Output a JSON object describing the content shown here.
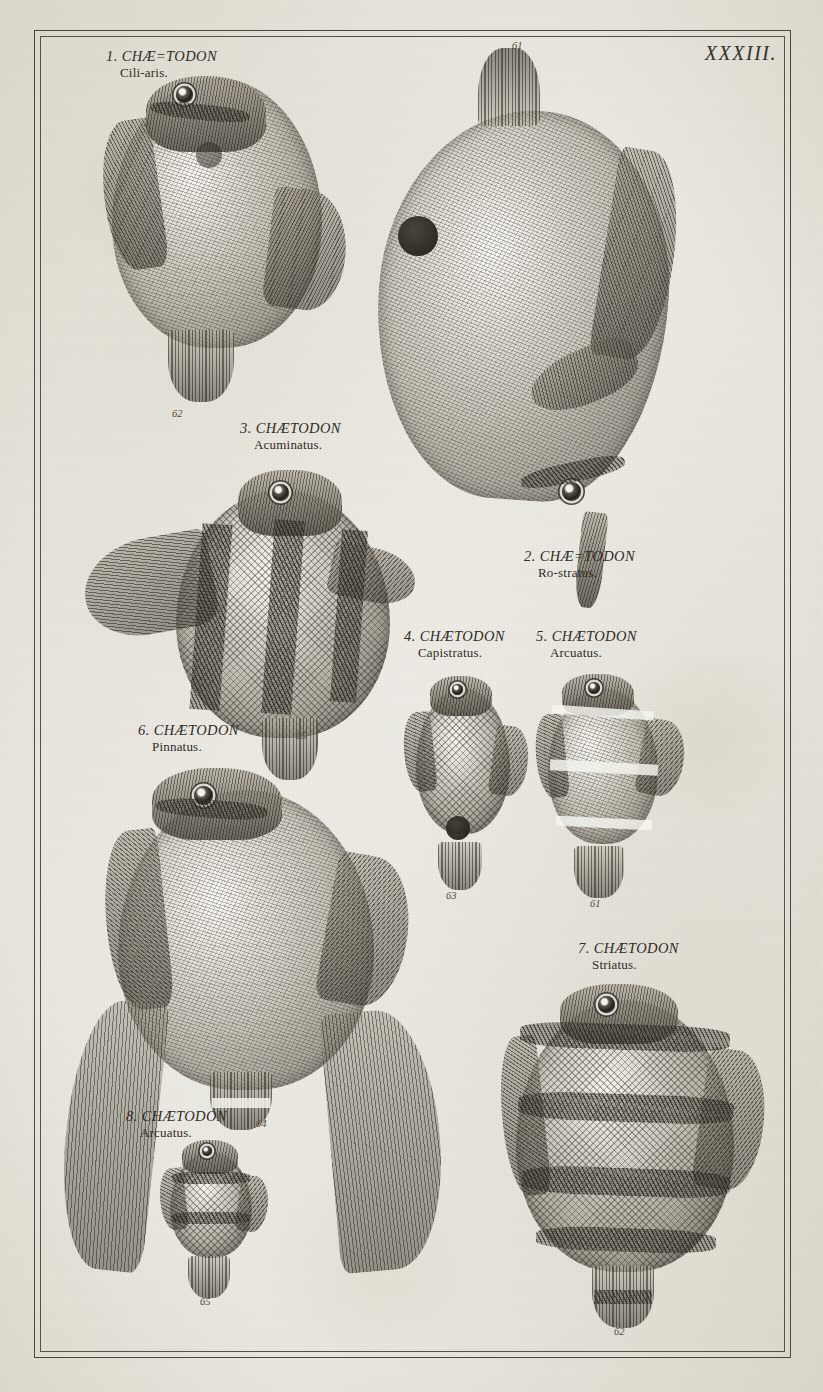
{
  "plate": {
    "number": "XXXIII.",
    "paper_color": "#efeeea",
    "ink_color": "#2e2b26"
  },
  "figures": [
    {
      "index": "1",
      "caption_line1": "1. CHÆ=TODON",
      "caption_line2": "Cili-aris.",
      "genus": "CHÆTODON",
      "species": "Ciliaris",
      "engraving_number": "62"
    },
    {
      "index": "2",
      "caption_line1": "2. CHÆ=TODON",
      "caption_line2": "Ro-stratus.",
      "genus": "CHÆTODON",
      "species": "Rostratus",
      "engraving_number": "61"
    },
    {
      "index": "3",
      "caption_line1": "3. CHÆTODON",
      "caption_line2": "Acuminatus.",
      "genus": "CHÆTODON",
      "species": "Acuminatus",
      "engraving_number": "65"
    },
    {
      "index": "4",
      "caption_line1": "4. CHÆTODON",
      "caption_line2": "Capistratus.",
      "genus": "CHÆTODON",
      "species": "Capistratus",
      "engraving_number": "63"
    },
    {
      "index": "5",
      "caption_line1": "5. CHÆTODON",
      "caption_line2": "Arcuatus.",
      "genus": "CHÆTODON",
      "species": "Arcuatus",
      "engraving_number": "61"
    },
    {
      "index": "6",
      "caption_line1": "6. CHÆTODON",
      "caption_line2": "Pinnatus.",
      "genus": "CHÆTODON",
      "species": "Pinnatus",
      "engraving_number": "64"
    },
    {
      "index": "7",
      "caption_line1": "7. CHÆTODON",
      "caption_line2": "Striatus.",
      "genus": "CHÆTODON",
      "species": "Striatus",
      "engraving_number": "62"
    },
    {
      "index": "8",
      "caption_line1": "8. CHÆTODON",
      "caption_line2": "Arcuatus.",
      "genus": "CHÆTODON",
      "species": "Arcuatus",
      "engraving_number": "65"
    }
  ]
}
